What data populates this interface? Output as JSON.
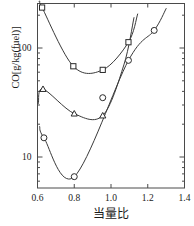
{
  "chart_data": {
    "type": "scatter",
    "title": "",
    "xlabel": "当量比",
    "ylabel": "CO[g/kg(fuel)]",
    "xlim": [
      0.6,
      1.4
    ],
    "ylim": [
      5,
      260
    ],
    "yscale": "log",
    "xscale": "linear",
    "grid": false,
    "legend": "none",
    "xticks": [
      "0.6",
      "0.8",
      "1.0",
      "1.2",
      "1.4"
    ],
    "xtick_values": [
      0.6,
      0.8,
      1.0,
      1.2,
      1.4
    ],
    "yticks": [
      "100",
      "10"
    ],
    "ytick_values": [
      100,
      10
    ],
    "series": [
      {
        "name": "square-series",
        "marker": "square",
        "x": [
          0.625,
          0.795,
          0.955,
          1.095
        ],
        "values": [
          235,
          68,
          63,
          113
        ]
      },
      {
        "name": "triangle-series",
        "marker": "triangle",
        "x": [
          0.63,
          0.8,
          0.955
        ],
        "values": [
          42,
          25,
          24
        ]
      },
      {
        "name": "circle-series",
        "marker": "circle",
        "x": [
          0.635,
          0.8,
          0.955,
          1.095,
          1.235
        ],
        "values": [
          15,
          6.6,
          35,
          77,
          145
        ]
      }
    ]
  },
  "axes": {
    "x_axis_name": "当量比",
    "y_axis_name": "CO[g/kg(fuel)]"
  }
}
